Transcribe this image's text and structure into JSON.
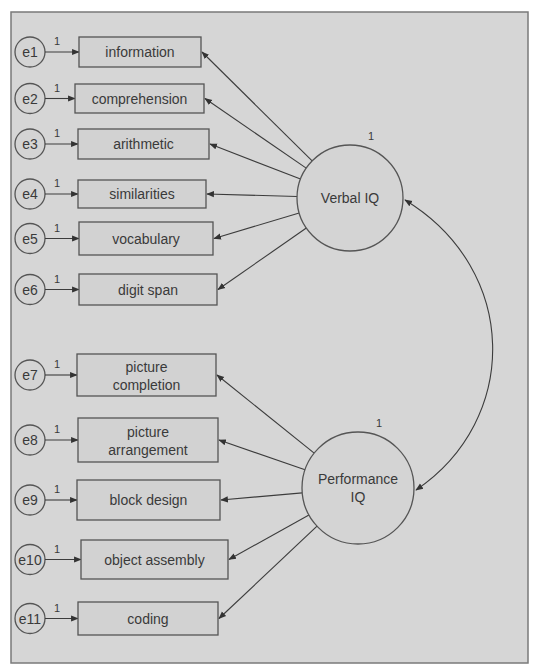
{
  "diagram": {
    "type": "structural-equation-model",
    "latent_variables": [
      {
        "id": "verbal",
        "label": "Verbal IQ",
        "variance_label": "1"
      },
      {
        "id": "performance",
        "label_line1": "Performance",
        "label_line2": "IQ",
        "variance_label": "1"
      }
    ],
    "observed_variables": [
      {
        "id": "information",
        "lines": [
          "information"
        ],
        "error": "e1",
        "error_path_label": "1",
        "factor": "verbal"
      },
      {
        "id": "comprehension",
        "lines": [
          "comprehension"
        ],
        "error": "e2",
        "error_path_label": "1",
        "factor": "verbal"
      },
      {
        "id": "arithmetic",
        "lines": [
          "arithmetic"
        ],
        "error": "e3",
        "error_path_label": "1",
        "factor": "verbal"
      },
      {
        "id": "similarities",
        "lines": [
          "similarities"
        ],
        "error": "e4",
        "error_path_label": "1",
        "factor": "verbal"
      },
      {
        "id": "vocabulary",
        "lines": [
          "vocabulary"
        ],
        "error": "e5",
        "error_path_label": "1",
        "factor": "verbal"
      },
      {
        "id": "digit-span",
        "lines": [
          "digit span"
        ],
        "error": "e6",
        "error_path_label": "1",
        "factor": "verbal"
      },
      {
        "id": "picture-completion",
        "lines": [
          "picture",
          "completion"
        ],
        "error": "e7",
        "error_path_label": "1",
        "factor": "performance"
      },
      {
        "id": "picture-arrangement",
        "lines": [
          "picture",
          "arrangement"
        ],
        "error": "e8",
        "error_path_label": "1",
        "factor": "performance"
      },
      {
        "id": "block-design",
        "lines": [
          "block design"
        ],
        "error": "e9",
        "error_path_label": "1",
        "factor": "performance"
      },
      {
        "id": "object-assembly",
        "lines": [
          "object assembly"
        ],
        "error": "e10",
        "error_path_label": "1",
        "factor": "performance"
      },
      {
        "id": "coding",
        "lines": [
          "coding"
        ],
        "error": "e11",
        "error_path_label": "1",
        "factor": "performance"
      }
    ],
    "covariance": {
      "from": "verbal",
      "to": "performance"
    },
    "colors": {
      "background": "#d6d6d6",
      "stroke": "#555555",
      "text": "#3a3a3a"
    }
  }
}
